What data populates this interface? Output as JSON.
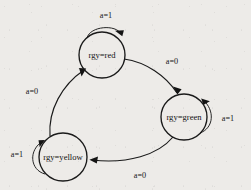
{
  "diagram": {
    "type": "finite-state-machine",
    "title": "",
    "background_color": "#edebe8",
    "stroke_color": "#1a1a1a",
    "states": [
      {
        "id": "red",
        "label": "rgy=red",
        "cx": 102,
        "cy": 55,
        "r": 23
      },
      {
        "id": "green",
        "label": "rgy=green",
        "cx": 184,
        "cy": 117,
        "r": 23
      },
      {
        "id": "yellow",
        "label": "rgy=yellow",
        "cx": 63,
        "cy": 157,
        "r": 24
      }
    ],
    "transitions": [
      {
        "from": "red",
        "to": "red",
        "label": "a=1",
        "kind": "self-loop",
        "label_x": 106,
        "label_y": 16
      },
      {
        "from": "red",
        "to": "green",
        "label": "a=0",
        "kind": "arc",
        "label_x": 172,
        "label_y": 62
      },
      {
        "from": "green",
        "to": "green",
        "label": "a=1",
        "kind": "self-loop",
        "label_x": 228,
        "label_y": 119
      },
      {
        "from": "green",
        "to": "yellow",
        "label": "a=0",
        "kind": "arc",
        "label_x": 140,
        "label_y": 176
      },
      {
        "from": "yellow",
        "to": "yellow",
        "label": "a=1",
        "kind": "self-loop",
        "label_x": 17,
        "label_y": 155
      },
      {
        "from": "yellow",
        "to": "red",
        "label": "a=0",
        "kind": "arc",
        "label_x": 32,
        "label_y": 92
      }
    ]
  }
}
